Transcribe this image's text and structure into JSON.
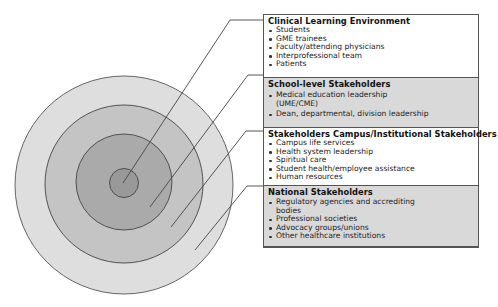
{
  "diagram": {
    "type": "concentric-circles-with-callouts",
    "rings": [
      {
        "id": "inner",
        "label_ref": "sections.0",
        "fill": "#9a9a9a"
      },
      {
        "id": "second",
        "label_ref": "sections.1",
        "fill": "#a8a8a8"
      },
      {
        "id": "third",
        "label_ref": "sections.2",
        "fill": "#c2c2c2"
      },
      {
        "id": "outer",
        "label_ref": "sections.3",
        "fill": "#dcdcdc"
      }
    ],
    "colors": {
      "stroke": "#444444",
      "panel_gray": "#d9d9d9",
      "panel_white": "#ffffff"
    }
  },
  "sections": [
    {
      "title": "Clinical Learning Environment",
      "items": [
        "Students",
        "GME trainees",
        "Faculty/attending physicians",
        "Interprofessional team",
        "Patients"
      ]
    },
    {
      "title": "School-level Stakeholders",
      "items": [
        "Medical education leadership (UME/CME)",
        "Dean, departmental, division leadership"
      ]
    },
    {
      "title": "Stakeholders Campus/Institutional Stakeholders",
      "items": [
        "Campus life services",
        "Health system leadership",
        "Spiritual care",
        "Student health/employee assistance",
        "Human resources"
      ]
    },
    {
      "title": "National Stakeholders",
      "items": [
        "Regulatory agencies and accrediting bodies",
        "Professional societies",
        "Advocacy groups/unions",
        "Other healthcare institutions"
      ]
    }
  ]
}
